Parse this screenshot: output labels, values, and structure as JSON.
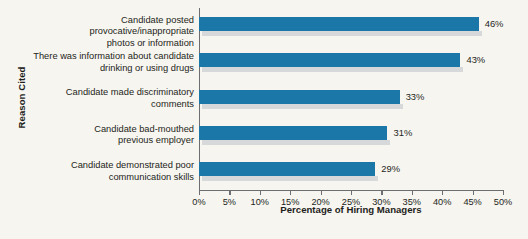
{
  "chart_data": {
    "type": "bar",
    "orientation": "horizontal",
    "title": "",
    "xlabel": "Percentage of Hiring Managers",
    "ylabel": "Reason Cited",
    "xlim": [
      0,
      50
    ],
    "grid": false,
    "legend": "none",
    "categories": [
      "Candidate posted provocative/inappropriate\nphotos or information",
      "There was information about candidate\ndrinking or using drugs",
      "Candidate made discriminatory\ncomments",
      "Candidate bad-mouthed\nprevious employer",
      "Candidate demonstrated poor\ncommunication skills"
    ],
    "values": [
      46,
      43,
      33,
      31,
      29
    ],
    "value_labels": [
      "46%",
      "43%",
      "33%",
      "31%",
      "29%"
    ],
    "xticks": [
      0,
      5,
      10,
      15,
      20,
      25,
      30,
      35,
      40,
      45,
      50
    ],
    "xtick_labels": [
      "0%",
      "5%",
      "10%",
      "15%",
      "20%",
      "25%",
      "30%",
      "35%",
      "40%",
      "45%",
      "50%"
    ],
    "colors": {
      "bar": "#1b77a8",
      "bar_shadow": "#d6d8da",
      "axis": "#6d6e71",
      "text": "#231f20",
      "background": "#f7f5f0"
    }
  }
}
